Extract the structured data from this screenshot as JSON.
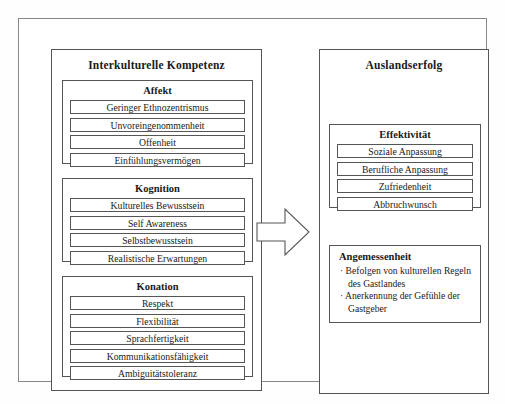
{
  "diagram": {
    "left_panel": {
      "title": "Interkulturelle Kompetenz",
      "groups": [
        {
          "title": "Affekt",
          "items": [
            "Geringer Ethnozentrismus",
            "Unvoreingenommenheit",
            "Offenheit",
            "Einfühlungsvermögen"
          ]
        },
        {
          "title": "Kognition",
          "items": [
            "Kulturelles Bewusstsein",
            "Self Awareness",
            "Selbstbewusstsein",
            "Realistische Erwartungen"
          ]
        },
        {
          "title": "Konation",
          "items": [
            "Respekt",
            "Flexibilität",
            "Sprachfertigkeit",
            "Kommunikationsfähigkeit",
            "Ambiguitätstoleranz"
          ]
        }
      ]
    },
    "right_panel": {
      "title": "Auslandserfolg",
      "groups": [
        {
          "title": "Effektivität",
          "items": [
            "Soziale Anpassung",
            "Berufliche Anpassung",
            "Zufriedenheit",
            "Abbruchwunsch"
          ]
        },
        {
          "title": "Angemessenheit",
          "bullets": [
            {
              "line1": "· Befolgen von kulturellen Regeln",
              "line2": "des Gastlandes"
            },
            {
              "line1": "· Anerkennung der Gefühle der",
              "line2": "Gastgeber"
            }
          ]
        }
      ]
    },
    "connector": {
      "icon": "right-block-arrow"
    },
    "caption": ""
  }
}
